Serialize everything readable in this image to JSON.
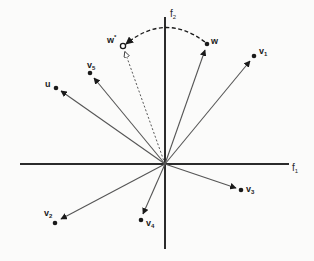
{
  "diagram": {
    "type": "vector-space-plot",
    "axes": {
      "horizontal": {
        "label_base": "f",
        "label_sub": "1"
      },
      "vertical": {
        "label_base": "f",
        "label_sub": "2"
      }
    },
    "origin": [
      165,
      164
    ],
    "vectors": [
      {
        "id": "w",
        "label_base": "w",
        "label_sub": "",
        "label_sup": "",
        "tip": [
          207,
          44
        ]
      },
      {
        "id": "v1",
        "label_base": "v",
        "label_sub": "1",
        "label_sup": "",
        "tip": [
          254,
          56
        ]
      },
      {
        "id": "v5",
        "label_base": "v",
        "label_sub": "5",
        "label_sup": "",
        "tip": [
          90,
          73
        ]
      },
      {
        "id": "u",
        "label_base": "u",
        "label_sub": "",
        "label_sup": "",
        "tip": [
          56,
          88
        ]
      },
      {
        "id": "v3",
        "label_base": "v",
        "label_sub": "3",
        "label_sup": "",
        "tip": [
          241,
          190
        ]
      },
      {
        "id": "v2",
        "label_base": "v",
        "label_sub": "2",
        "label_sup": "",
        "tip": [
          55,
          223
        ]
      },
      {
        "id": "v4",
        "label_base": "v",
        "label_sub": "4",
        "label_sup": "",
        "tip": [
          141,
          220
        ]
      }
    ],
    "projected_vector": {
      "id": "w-star",
      "label_base": "w",
      "label_sup": "*",
      "tip": [
        123,
        46
      ],
      "style": "dashed"
    },
    "rotation_arc": {
      "from": "w",
      "to": "w-star",
      "style": "dashed"
    },
    "colors": {
      "axis": "#2b2b2b",
      "vector": "#555555",
      "point": "#1a1a1a",
      "background": "#fbfbfa"
    }
  }
}
